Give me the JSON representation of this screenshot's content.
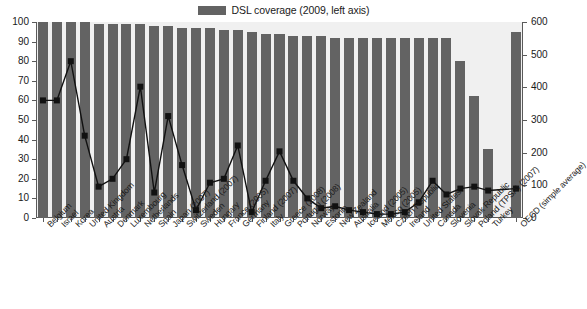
{
  "legend": {
    "series_label": "DSL coverage (2009, left axis)",
    "swatch_color": "#636363"
  },
  "axes": {
    "left_ticks": [
      "0",
      "10",
      "20",
      "30",
      "40",
      "50",
      "60",
      "70",
      "80",
      "90",
      "100"
    ],
    "right_ticks": [
      "0",
      "100",
      "200",
      "300",
      "400",
      "500",
      "600"
    ],
    "left_min": 0,
    "left_max": 100,
    "right_min": 0,
    "right_max": 600
  },
  "chart_data": {
    "type": "bar",
    "title": "",
    "subtitle": "",
    "xlabel": "",
    "ylabel": "",
    "ylim": [
      0,
      100
    ],
    "y2lim": [
      0,
      600
    ],
    "grid": false,
    "legend_position": "top-center",
    "categories": [
      "Belgium",
      "Israel",
      "Korea",
      "United Kingdom",
      "Austria",
      "Denmark",
      "Luxembourg",
      "Netherlands",
      "Spain",
      "Japan (2007)",
      "Switzerland (2007)",
      "Sweden",
      "Hungary",
      "France (2005)",
      "Germany",
      "Finland (2007)",
      "Italy",
      "Greece (2008)",
      "Portugal (2008)",
      "Norway",
      "Estonia",
      "New Zealand",
      "Australia",
      "Iceland (2005)",
      "Mexico (2005)",
      "Czech Republic",
      "Ireland",
      "United States",
      "Canada",
      "Slovenia",
      "Slovak Republic",
      "Poland (TPSA) (2007)",
      "Turkey",
      "OECD (simple average)"
    ],
    "series": [
      {
        "name": "DSL coverage (2009, left axis)",
        "type": "bar",
        "axis": "left",
        "color": "#636363",
        "values": [
          100,
          100,
          100,
          100,
          99,
          99,
          99,
          99,
          98,
          98,
          97,
          97,
          97,
          96,
          96,
          95,
          94,
          94,
          93,
          93,
          93,
          92,
          92,
          92,
          92,
          92,
          92,
          92,
          92,
          92,
          80,
          62,
          35,
          95
        ]
      },
      {
        "name": "Line series (right axis)",
        "type": "line",
        "axis": "right",
        "color": "#111111",
        "marker": "square",
        "values_left_scale": [
          60,
          60,
          80,
          42,
          16,
          20,
          30,
          67,
          13,
          52,
          27,
          4,
          18,
          20,
          37,
          3,
          19,
          34,
          19,
          10,
          5,
          6,
          4,
          3,
          2,
          2,
          3,
          8,
          19,
          12,
          15,
          16,
          14,
          15
        ],
        "values": [
          360,
          360,
          480,
          252,
          96,
          120,
          180,
          402,
          78,
          312,
          162,
          24,
          108,
          120,
          222,
          18,
          114,
          204,
          114,
          60,
          30,
          36,
          24,
          18,
          12,
          12,
          18,
          48,
          114,
          72,
          90,
          96,
          84,
          90
        ]
      }
    ]
  }
}
